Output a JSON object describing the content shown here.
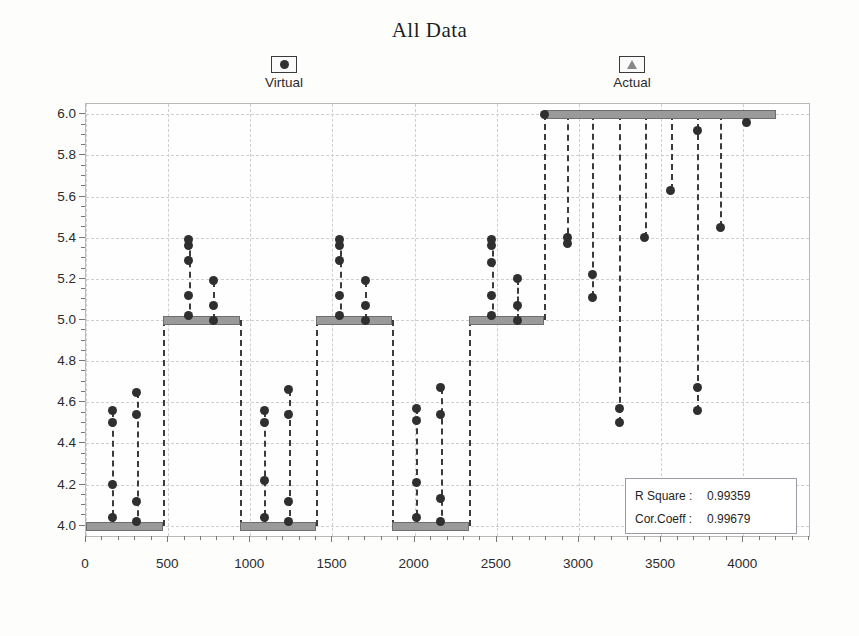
{
  "title": "All Data",
  "legend": {
    "position": "top",
    "items": [
      {
        "label": "Virtual",
        "marker": "dot-marker-icon",
        "color": "#333333"
      },
      {
        "label": "Actual",
        "marker": "triangle-marker-icon",
        "color": "#888888"
      }
    ]
  },
  "stats": {
    "rows": [
      {
        "key": "R Square :",
        "value": "0.99359"
      },
      {
        "key": "Cor.Coeff :",
        "value": "0.99679"
      }
    ]
  },
  "chart_data": {
    "type": "scatter",
    "title": "All Data",
    "xlabel": "",
    "ylabel": "Leakage Index",
    "xlim": [
      0,
      4400
    ],
    "ylim": [
      3.95,
      6.05
    ],
    "grid": true,
    "x_ticks": [
      0,
      500,
      1000,
      1500,
      2000,
      2500,
      3000,
      3500,
      4000
    ],
    "y_ticks": [
      4.0,
      4.2,
      4.4,
      4.6,
      4.8,
      5.0,
      5.2,
      5.4,
      5.6,
      5.8,
      6.0
    ],
    "y_tick_labels": [
      "4.0",
      "4.2",
      "4.4",
      "4.6",
      "4.8",
      "5.0",
      "5.2",
      "5.4",
      "5.6",
      "5.8",
      "6.0"
    ],
    "x_tick_labels": [
      "0",
      "500",
      "1000",
      "1500",
      "2000",
      "2500",
      "3000",
      "3500",
      "4000"
    ],
    "bars": [
      {
        "y": 4.0,
        "x0": 0,
        "x1": 470
      },
      {
        "y": 5.0,
        "x0": 470,
        "x1": 935
      },
      {
        "y": 4.0,
        "x0": 935,
        "x1": 1400
      },
      {
        "y": 5.0,
        "x0": 1400,
        "x1": 1865
      },
      {
        "y": 4.0,
        "x0": 1865,
        "x1": 2330
      },
      {
        "y": 5.0,
        "x0": 2330,
        "x1": 2790
      },
      {
        "y": 6.0,
        "x0": 2790,
        "x1": 4200
      }
    ],
    "series": [
      {
        "name": "Virtual",
        "marker": "circle",
        "color": "#2f2f2f",
        "points": [
          {
            "x": 160,
            "y": 4.04
          },
          {
            "x": 160,
            "y": 4.2
          },
          {
            "x": 160,
            "y": 4.5
          },
          {
            "x": 160,
            "y": 4.56
          },
          {
            "x": 310,
            "y": 4.02
          },
          {
            "x": 310,
            "y": 4.12
          },
          {
            "x": 310,
            "y": 4.54
          },
          {
            "x": 310,
            "y": 4.65
          },
          {
            "x": 625,
            "y": 5.02
          },
          {
            "x": 625,
            "y": 5.12
          },
          {
            "x": 625,
            "y": 5.29
          },
          {
            "x": 625,
            "y": 5.36
          },
          {
            "x": 625,
            "y": 5.39
          },
          {
            "x": 775,
            "y": 5.0
          },
          {
            "x": 775,
            "y": 5.07
          },
          {
            "x": 775,
            "y": 5.19
          },
          {
            "x": 1085,
            "y": 4.04
          },
          {
            "x": 1085,
            "y": 4.22
          },
          {
            "x": 1085,
            "y": 4.5
          },
          {
            "x": 1085,
            "y": 4.56
          },
          {
            "x": 1235,
            "y": 4.02
          },
          {
            "x": 1235,
            "y": 4.12
          },
          {
            "x": 1235,
            "y": 4.54
          },
          {
            "x": 1235,
            "y": 4.66
          },
          {
            "x": 1545,
            "y": 5.02
          },
          {
            "x": 1545,
            "y": 5.12
          },
          {
            "x": 1545,
            "y": 5.29
          },
          {
            "x": 1545,
            "y": 5.36
          },
          {
            "x": 1545,
            "y": 5.39
          },
          {
            "x": 1700,
            "y": 5.0
          },
          {
            "x": 1700,
            "y": 5.07
          },
          {
            "x": 1700,
            "y": 5.19
          },
          {
            "x": 2010,
            "y": 4.04
          },
          {
            "x": 2010,
            "y": 4.21
          },
          {
            "x": 2010,
            "y": 4.51
          },
          {
            "x": 2010,
            "y": 4.57
          },
          {
            "x": 2160,
            "y": 4.02
          },
          {
            "x": 2160,
            "y": 4.13
          },
          {
            "x": 2160,
            "y": 4.54
          },
          {
            "x": 2160,
            "y": 4.67
          },
          {
            "x": 2470,
            "y": 5.02
          },
          {
            "x": 2470,
            "y": 5.12
          },
          {
            "x": 2470,
            "y": 5.28
          },
          {
            "x": 2470,
            "y": 5.36
          },
          {
            "x": 2470,
            "y": 5.39
          },
          {
            "x": 2625,
            "y": 5.0
          },
          {
            "x": 2625,
            "y": 5.07
          },
          {
            "x": 2625,
            "y": 5.2
          }
        ]
      },
      {
        "name": "Actual",
        "marker": "circle",
        "color": "#2f2f2f",
        "points": [
          {
            "x": 2790,
            "y": 6.0
          },
          {
            "x": 2930,
            "y": 5.37
          },
          {
            "x": 2930,
            "y": 5.4
          },
          {
            "x": 3080,
            "y": 5.11
          },
          {
            "x": 3080,
            "y": 5.22
          },
          {
            "x": 3245,
            "y": 4.5
          },
          {
            "x": 3245,
            "y": 4.57
          },
          {
            "x": 3400,
            "y": 5.4
          },
          {
            "x": 3560,
            "y": 5.63
          },
          {
            "x": 3720,
            "y": 5.92
          },
          {
            "x": 3720,
            "y": 4.56
          },
          {
            "x": 3720,
            "y": 4.67
          },
          {
            "x": 3860,
            "y": 5.45
          },
          {
            "x": 4020,
            "y": 5.96
          }
        ]
      }
    ],
    "stems": [
      {
        "x": 160,
        "y0": 4.0,
        "y1": 4.56
      },
      {
        "x": 310,
        "y0": 4.0,
        "y1": 4.65
      },
      {
        "x": 625,
        "y0": 5.0,
        "y1": 5.39
      },
      {
        "x": 775,
        "y0": 5.0,
        "y1": 5.19
      },
      {
        "x": 1085,
        "y0": 4.0,
        "y1": 4.56
      },
      {
        "x": 1235,
        "y0": 4.0,
        "y1": 4.66
      },
      {
        "x": 1545,
        "y0": 5.0,
        "y1": 5.39
      },
      {
        "x": 1700,
        "y0": 5.0,
        "y1": 5.19
      },
      {
        "x": 2010,
        "y0": 4.0,
        "y1": 4.57
      },
      {
        "x": 2160,
        "y0": 4.0,
        "y1": 4.67
      },
      {
        "x": 2470,
        "y0": 5.0,
        "y1": 5.39
      },
      {
        "x": 2625,
        "y0": 5.0,
        "y1": 5.2
      },
      {
        "x": 2790,
        "y0": 5.0,
        "y1": 6.0
      },
      {
        "x": 2930,
        "y0": 5.37,
        "y1": 6.0
      },
      {
        "x": 3080,
        "y0": 5.11,
        "y1": 6.0
      },
      {
        "x": 3245,
        "y0": 4.5,
        "y1": 6.0
      },
      {
        "x": 3400,
        "y0": 5.4,
        "y1": 6.0
      },
      {
        "x": 3560,
        "y0": 5.63,
        "y1": 6.0
      },
      {
        "x": 3720,
        "y0": 4.56,
        "y1": 6.0
      },
      {
        "x": 3860,
        "y0": 5.45,
        "y1": 6.0
      },
      {
        "x": 470,
        "y0": 4.0,
        "y1": 5.0
      },
      {
        "x": 935,
        "y0": 4.0,
        "y1": 5.0
      },
      {
        "x": 1400,
        "y0": 4.0,
        "y1": 5.0
      },
      {
        "x": 1865,
        "y0": 4.0,
        "y1": 5.0
      },
      {
        "x": 2330,
        "y0": 4.0,
        "y1": 5.0
      }
    ]
  }
}
